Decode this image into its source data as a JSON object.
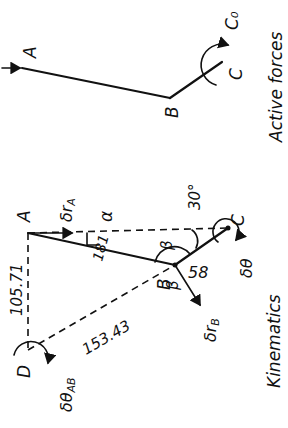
{
  "top_diagram": {
    "caption": "Active forces",
    "points": {
      "A": "A",
      "B": "B",
      "C": "C"
    },
    "moment_label": "C₀"
  },
  "bottom_diagram": {
    "caption": "Kinematics",
    "points": {
      "A": "A",
      "B": "B",
      "C": "C",
      "D": "D"
    },
    "labels": {
      "delta_rA": "δr",
      "delta_rA_sub": "A",
      "delta_rB": "δr",
      "delta_rB_sub": "B",
      "delta_theta": "δθ",
      "delta_theta_AB": "δθ",
      "delta_theta_AB_sub": "AB",
      "alpha": "α",
      "beta_1": "β",
      "beta_2": "β",
      "angle_30": "30°",
      "dim_AD": "105.71",
      "dim_DB": "153.43",
      "dim_AB": "181",
      "dim_BC": "58"
    }
  },
  "colors": {
    "ink": "#111111",
    "background": "#ffffff"
  }
}
